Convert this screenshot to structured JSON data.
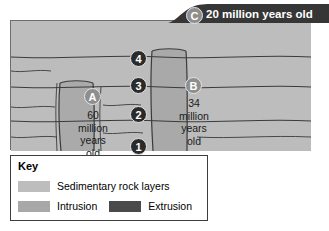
{
  "diagram": {
    "extrusion": {
      "badge": "C",
      "label": "20 million years old"
    },
    "intrusions": [
      {
        "badge": "A",
        "label": "60\nmillion\nyears\nold",
        "lines": [
          "60",
          "million",
          "years",
          "old"
        ]
      },
      {
        "badge": "B",
        "label": "34\nmillion\nyears\nold",
        "lines": [
          "34",
          "million",
          "years",
          "old"
        ]
      }
    ],
    "layers": [
      {
        "badge": "4"
      },
      {
        "badge": "3"
      },
      {
        "badge": "2"
      },
      {
        "badge": "1"
      }
    ]
  },
  "legend": {
    "title": "Key",
    "entries": [
      {
        "label": "Sedimentary rock layers",
        "color": "#bdbdbd",
        "name": "sedimentary"
      },
      {
        "label": "Intrusion",
        "color": "#a8a8a8",
        "name": "intrusion"
      },
      {
        "label": "Extrusion",
        "color": "#4a4a4a",
        "name": "extrusion"
      }
    ]
  },
  "colors": {
    "sedimentary": "#bdbdbd",
    "intrusion": "#a8a8a8",
    "extrusion": "#363636",
    "outline": "#3b3b3b",
    "badge_dark": "#2b2b2b",
    "badge_gray": "#8e8e8e"
  }
}
